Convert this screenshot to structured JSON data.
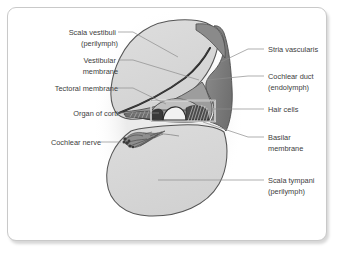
{
  "figure": {
    "frame_border_color": "#c9c9c9",
    "background_color": "#ffffff"
  },
  "palette": {
    "halo": "#efefef",
    "chamber_fill": "#d7d7d7",
    "chamber_fill_light": "#dededc",
    "stria_dark": "#8a8a8a",
    "stria_darker": "#6f6f6f",
    "duct_fill": "#9a9a9a",
    "outline": "#555555",
    "membrane_dark": "#2e2e2e",
    "corti_dark": "#2b2b2b",
    "nerve_gray": "#707070",
    "leader_line": "#8d8d8d",
    "label_text": "#3d3d3d"
  },
  "labels": {
    "left": [
      {
        "id": "scala-vestibuli",
        "lines": [
          "Scala vestibuli",
          "(perilymph)"
        ],
        "text_x": 113,
        "text_y": 35,
        "line_height": 11,
        "leader": "M 118,32 L 133,32 L 178,57"
      },
      {
        "id": "vestibular-membrane",
        "lines": [
          "Vestibular",
          "membrane"
        ],
        "text_x": 113,
        "text_y": 63,
        "line_height": 11,
        "leader": "M 118,60 L 133,60 L 200,80"
      },
      {
        "id": "tectoral-membrane",
        "lines": [
          "Tectoral membrane"
        ],
        "text_x": 113,
        "text_y": 91,
        "line_height": 11,
        "leader": "M 118,88 L 133,88 L 166,104"
      },
      {
        "id": "organ-of-corti",
        "lines": [
          "Organ of corti"
        ],
        "text_x": 113,
        "text_y": 116,
        "line_height": 11,
        "leader": "M 118,113 L 133,113 L 160,113"
      },
      {
        "id": "cochlear-nerve",
        "lines": [
          "Cochlear nerve"
        ],
        "text_x": 97,
        "text_y": 145,
        "line_height": 11,
        "leader": "M 101,142 L 120,142"
      }
    ],
    "right": [
      {
        "id": "stria-vascularis",
        "lines": [
          "Stria vascularis"
        ],
        "text_x": 268,
        "text_y": 52,
        "line_height": 11,
        "leader": "M 264,49 L 248,49 L 221,62"
      },
      {
        "id": "cochlear-duct",
        "lines": [
          "Cochlear duct",
          "(endolymph)"
        ],
        "text_x": 268,
        "text_y": 79,
        "line_height": 11,
        "leader": "M 264,76 L 248,76 L 206,79"
      },
      {
        "id": "hair-cells",
        "lines": [
          "Hair cells"
        ],
        "text_x": 268,
        "text_y": 112,
        "line_height": 11,
        "leader": "M 264,109 L 248,109 L 213,109"
      },
      {
        "id": "basilar-membrane",
        "lines": [
          "Basilar",
          "membrane"
        ],
        "text_x": 268,
        "text_y": 140,
        "line_height": 11,
        "leader": "M 264,137 L 248,137 L 204,122"
      },
      {
        "id": "scala-tympani",
        "lines": [
          "Scala tympani",
          "(perilymph)"
        ],
        "text_x": 268,
        "text_y": 183,
        "line_height": 11,
        "leader": "M 264,180 L 248,180 L 158,180"
      }
    ]
  },
  "structures": {
    "halo": "outer-soft-glow",
    "scala_vestibuli": "upper-oval-chamber",
    "scala_tympani": "lower-rounded-chamber",
    "cochlear_duct": "triangular-middle-chamber",
    "stria_vascularis": "dark-lateral-wall-band",
    "vestibular_membrane": "diagonal-dark-line",
    "tectorial_membrane": "thin-flap-over-hair-cells",
    "basilar_membrane": "lower-duct-boundary",
    "organ_of_corti": "tunnel-of-corti-detail-box",
    "cochlear_nerve": "nerve-fiber-bundle"
  }
}
